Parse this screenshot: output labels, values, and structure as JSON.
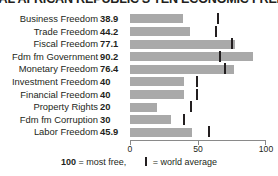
{
  "chart_data": {
    "type": "bar",
    "title": "CENTRAL AFRICAN REPUBLIC'S TEN ECONOMIC FREEDOMS",
    "xlabel": "",
    "ylabel": "",
    "xlim": [
      0,
      100
    ],
    "grid": false,
    "orientation": "horizontal",
    "categories": [
      "Business Freedom",
      "Trade Freedom",
      "Fiscal Freedom",
      "Fdm fm Government",
      "Monetary Freedom",
      "Investment Freedom",
      "Financial Freedom",
      "Property Rights",
      "Fdm fm Corruption",
      "Labor Freedom"
    ],
    "values": [
      38.9,
      44.2,
      77.1,
      90.2,
      76.4,
      40,
      40,
      20,
      30,
      45.9
    ],
    "value_labels": [
      "38.9",
      "44.2",
      "77.1",
      "90.2",
      "76.4",
      "40",
      "40",
      "20",
      "30",
      "45.9"
    ],
    "world_average": [
      65,
      63,
      75,
      66,
      70,
      49,
      49,
      45,
      40,
      58
    ],
    "axis_ticks": [
      0,
      50,
      100
    ],
    "axis_tick_labels": [
      "0",
      "50",
      "100"
    ],
    "series": [
      {
        "name": "Central African Republic",
        "values": [
          38.9,
          44.2,
          77.1,
          90.2,
          76.4,
          40,
          40,
          20,
          30,
          45.9
        ]
      },
      {
        "name": "world average",
        "values": [
          65,
          63,
          75,
          66,
          70,
          49,
          49,
          45,
          40,
          58
        ]
      }
    ],
    "colors": {
      "bar": "#a9a9a9",
      "tick": "#231f20",
      "text": "#231f20",
      "axis": "#8a8a8a"
    }
  },
  "legend": {
    "most_free_value": "100",
    "most_free_text": "= most free,",
    "world_average_text": "= world average"
  }
}
